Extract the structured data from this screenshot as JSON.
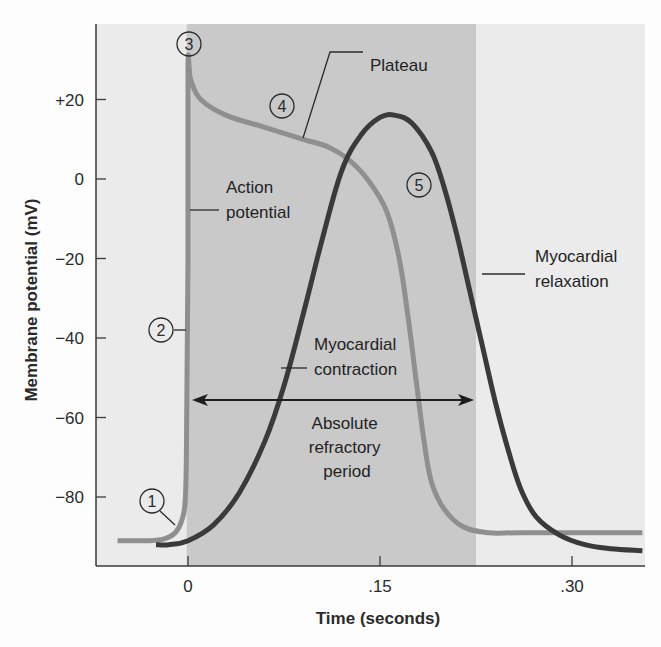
{
  "chart_data": {
    "type": "line",
    "title": "",
    "xlabel": "Time (seconds)",
    "ylabel": "Membrane potential (mV)",
    "xlim": [
      -0.075,
      0.355
    ],
    "ylim": [
      -100,
      37
    ],
    "grid": false,
    "legend": "none (curves labeled by annotations)",
    "x_ticks": [
      {
        "value": 0,
        "label": "0"
      },
      {
        "value": 0.15,
        "label": ".15"
      },
      {
        "value": 0.3,
        "label": ".30"
      }
    ],
    "y_ticks": [
      {
        "value": 20,
        "label": "+20"
      },
      {
        "value": 0,
        "label": "0"
      },
      {
        "value": -20,
        "label": "−20"
      },
      {
        "value": -40,
        "label": "−40"
      },
      {
        "value": -60,
        "label": "−60"
      },
      {
        "value": -80,
        "label": "−80"
      }
    ],
    "shaded_regions": [
      {
        "name": "Absolute refractory period",
        "x_start": -0.001,
        "x_end": 0.225,
        "color": "#c9c9c9"
      }
    ],
    "series": [
      {
        "name": "Action potential",
        "color": "#8f8f8f",
        "width": 5,
        "points": [
          [
            -0.055,
            -91
          ],
          [
            -0.03,
            -91
          ],
          [
            -0.018,
            -90.5
          ],
          [
            -0.01,
            -89
          ],
          [
            -0.005,
            -86
          ],
          [
            -0.002,
            -80
          ],
          [
            -0.001,
            -60
          ],
          [
            0.0,
            -20
          ],
          [
            0.0,
            28
          ],
          [
            0.002,
            25
          ],
          [
            0.01,
            20
          ],
          [
            0.03,
            16
          ],
          [
            0.06,
            13
          ],
          [
            0.09,
            10
          ],
          [
            0.11,
            8
          ],
          [
            0.125,
            5
          ],
          [
            0.14,
            0
          ],
          [
            0.155,
            -8
          ],
          [
            0.165,
            -20
          ],
          [
            0.172,
            -35
          ],
          [
            0.178,
            -50
          ],
          [
            0.184,
            -65
          ],
          [
            0.19,
            -76
          ],
          [
            0.2,
            -83
          ],
          [
            0.215,
            -87.5
          ],
          [
            0.235,
            -89
          ],
          [
            0.26,
            -89
          ],
          [
            0.355,
            -89
          ]
        ]
      },
      {
        "name": "Myocardial contraction",
        "color": "#3a3a3a",
        "width": 5,
        "points": [
          [
            -0.025,
            -92
          ],
          [
            -0.015,
            -92
          ],
          [
            0.0,
            -91
          ],
          [
            0.02,
            -87
          ],
          [
            0.04,
            -79
          ],
          [
            0.06,
            -66
          ],
          [
            0.075,
            -52
          ],
          [
            0.09,
            -34
          ],
          [
            0.105,
            -15
          ],
          [
            0.12,
            2
          ],
          [
            0.135,
            11
          ],
          [
            0.15,
            15.5
          ],
          [
            0.162,
            16
          ],
          [
            0.175,
            14
          ],
          [
            0.19,
            7
          ],
          [
            0.2,
            -2
          ],
          [
            0.21,
            -14
          ],
          [
            0.22,
            -28
          ],
          [
            0.23,
            -42
          ],
          [
            0.24,
            -56
          ],
          [
            0.25,
            -68
          ],
          [
            0.26,
            -78
          ],
          [
            0.272,
            -85
          ],
          [
            0.29,
            -89.5
          ],
          [
            0.31,
            -92
          ],
          [
            0.33,
            -93
          ],
          [
            0.355,
            -93.5
          ]
        ]
      }
    ],
    "annotations": [
      {
        "id": "1",
        "text": "1",
        "type": "numbered-marker",
        "x": -0.029,
        "y": -82
      },
      {
        "id": "2",
        "text": "2",
        "type": "numbered-marker",
        "x": -0.029,
        "y": -40
      },
      {
        "id": "3",
        "text": "3",
        "type": "numbered-marker",
        "x": 0.0,
        "y": 34
      },
      {
        "id": "4",
        "text": "4",
        "type": "numbered-marker",
        "x": 0.045,
        "y": 18
      },
      {
        "id": "5",
        "text": "5",
        "type": "numbered-marker",
        "x": 0.17,
        "y": -1
      },
      {
        "id": "action_potential",
        "text": [
          "Action",
          "potential"
        ]
      },
      {
        "id": "plateau",
        "text": [
          "Plateau"
        ]
      },
      {
        "id": "myocardial_contraction",
        "text": [
          "Myocardial",
          "contraction"
        ]
      },
      {
        "id": "myocardial_relaxation",
        "text": [
          "Myocardial",
          "relaxation"
        ]
      },
      {
        "id": "absolute_refractory_period",
        "text": [
          "Absolute",
          "refractory",
          "period"
        ],
        "arrow": {
          "x_start": 0.003,
          "x_end": 0.222,
          "y": -55,
          "double_headed": true
        }
      }
    ]
  },
  "colors": {
    "background": "#fdfdfd",
    "plot_light": "#ebebeb",
    "plot_shaded": "#c9c9c9",
    "axis": "#3a3a3a",
    "action_potential": "#8f8f8f",
    "contraction": "#3a3a3a"
  }
}
